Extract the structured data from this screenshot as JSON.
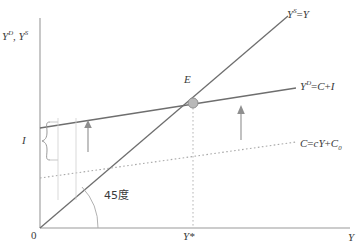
{
  "diagram": {
    "type": "keynesian-cross",
    "title_visible": false,
    "colors": {
      "axis": "#8c8c8c",
      "line": "#6e6e6e",
      "dotted": "#a8a8a8",
      "point_fill": "#b3b3b3",
      "point_stroke": "#8a8a8a",
      "text": "#3a3a3a",
      "background": "#ffffff"
    },
    "axes": {
      "y_axis_label_parts": [
        "Y",
        "D",
        ", ",
        "Y",
        "S"
      ],
      "y_axis_label": "Y^D, Y^S",
      "x_axis_label": "Y",
      "origin_label": "0"
    },
    "curves": [
      {
        "id": "supply-45",
        "label": "Y^S=Y",
        "label_parts": {
          "base1": "Y",
          "sup1": "S",
          "mid": "=",
          "base2": "Y"
        },
        "style": "solid",
        "description": "45 degree line through origin"
      },
      {
        "id": "aggregate-demand",
        "label": "Y^D=C+I",
        "label_parts": {
          "base1": "Y",
          "sup1": "D",
          "rest": "=C+I"
        },
        "style": "solid",
        "description": "aggregate demand, consumption plus investment"
      },
      {
        "id": "consumption",
        "label": "C=cY+C_0",
        "label_parts": {
          "lead": "C=cY+C",
          "sub": "0"
        },
        "style": "dotted",
        "description": "consumption function with autonomous consumption"
      }
    ],
    "points": [
      {
        "id": "equilibrium",
        "label": "E",
        "x_tick_label": "Y*"
      }
    ],
    "annotations": [
      {
        "id": "investment-bracket",
        "label": "I",
        "kind": "brace",
        "description": "vertical gap between consumption and aggregate demand lines"
      },
      {
        "id": "angle-marker",
        "label": "45度",
        "kind": "arc",
        "description": "45 degree angle at origin"
      },
      {
        "id": "arrow-left",
        "label": "",
        "kind": "up-arrow"
      },
      {
        "id": "arrow-right",
        "label": "",
        "kind": "up-arrow"
      }
    ]
  }
}
